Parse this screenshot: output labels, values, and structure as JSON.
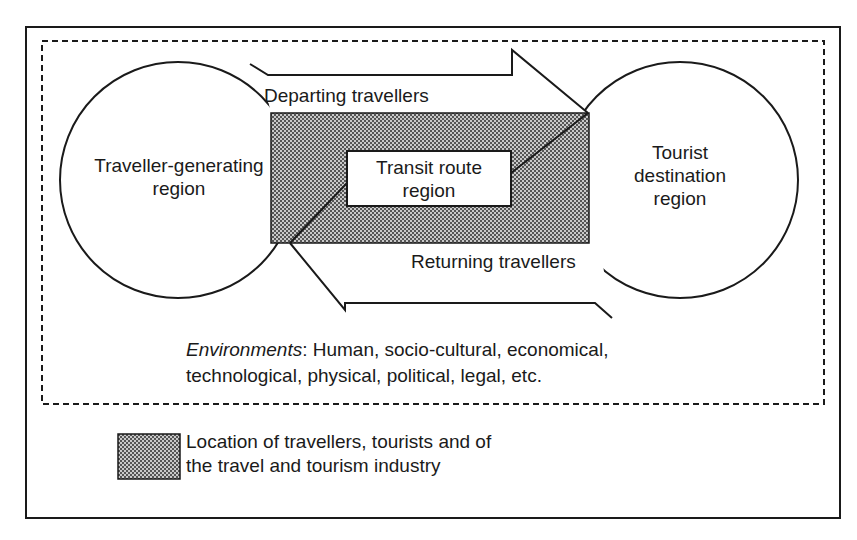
{
  "diagram": {
    "type": "tourism-system-model",
    "regions": {
      "generating": {
        "line1": "Traveller-generating",
        "line2": "region"
      },
      "transit": {
        "line1": "Transit route",
        "line2": "region"
      },
      "destination": {
        "line1": "Tourist",
        "line2": "destination",
        "line3": "region"
      }
    },
    "flows": {
      "departing": "Departing travellers",
      "returning": "Returning travellers"
    },
    "environments": {
      "label": "Environments",
      "text_line1": ": Human, socio-cultural, economical,",
      "text_line2": "technological, physical, political, legal, etc."
    },
    "legend": {
      "line1": "Location of travellers, tourists and of",
      "line2": "the travel and tourism industry"
    },
    "colors": {
      "stroke": "#1a1a1a",
      "shade": "#8c8c8c",
      "background": "#ffffff"
    }
  }
}
